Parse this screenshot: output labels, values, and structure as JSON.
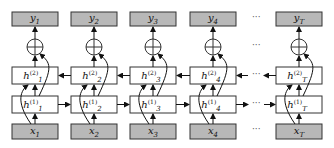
{
  "diagram": {
    "type": "stacked bidirectional RNN",
    "colors": {
      "io_fill": "#b8b8b8",
      "hidden_fill": "#ffffff",
      "stroke": "#333333"
    },
    "columns": [
      {
        "x": "x",
        "xi": "1",
        "h1": "h",
        "h1i": "1",
        "h2": "h",
        "h2i": "1",
        "y": "y",
        "yi": "1"
      },
      {
        "x": "x",
        "xi": "2",
        "h1": "h",
        "h1i": "2",
        "h2": "h",
        "h2i": "2",
        "y": "y",
        "yi": "2"
      },
      {
        "x": "x",
        "xi": "3",
        "h1": "h",
        "h1i": "3",
        "h2": "h",
        "h2i": "3",
        "y": "y",
        "yi": "3"
      },
      {
        "x": "x",
        "xi": "4",
        "h1": "h",
        "h1i": "4",
        "h2": "h",
        "h2i": "4",
        "y": "y",
        "yi": "4"
      },
      {
        "x": "x",
        "xi": "T",
        "h1": "h",
        "h1i": "T",
        "h2": "h",
        "h2i": "T",
        "y": "y",
        "yi": "T"
      }
    ],
    "layer1_sup": "(1)",
    "layer2_sup": "(2)",
    "ellipsis": "···"
  }
}
